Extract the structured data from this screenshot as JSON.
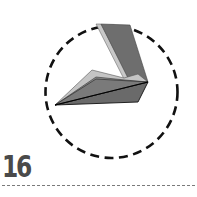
{
  "step": {
    "number": "16"
  },
  "diagram": {
    "colors": {
      "dark_fold": "#6e6e6e",
      "mid_fold": "#8a8a8a",
      "light_fold": "#c4c4c4",
      "outline": "#111111",
      "dashed_circle": "#111111",
      "divider": "#7a7a7a",
      "step_number": "#4a4a4a"
    },
    "circle": {
      "cx": 111.5,
      "cy": 92,
      "r": 66,
      "style": "dashed"
    }
  }
}
